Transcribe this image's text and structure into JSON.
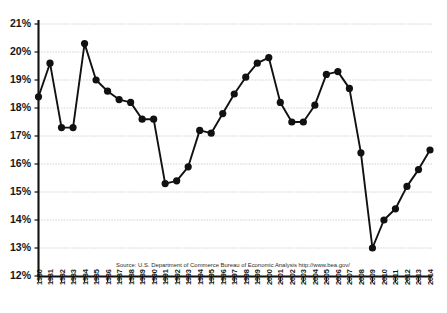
{
  "chart_data": {
    "type": "line",
    "title": "",
    "subtitle": "",
    "xlabel": "",
    "ylabel": "",
    "xlim": [
      1980,
      2014
    ],
    "ylim": [
      12,
      21
    ],
    "ytick_labels": [
      "21%",
      "20%",
      "19%",
      "18%",
      "17%",
      "16%",
      "15%",
      "14%",
      "13%",
      "12%"
    ],
    "ytick_values": [
      21,
      20,
      19,
      18,
      17,
      16,
      15,
      14,
      13,
      12
    ],
    "grid": true,
    "legend": "none",
    "marker": "filled-circle",
    "series_color": "#111111",
    "grid_color": "#c9c9c9",
    "axis_color": "#111111",
    "categories": [
      "1980",
      "1981",
      "1982",
      "1983",
      "1984",
      "1985",
      "1986",
      "1987",
      "1988",
      "1989",
      "1990",
      "1991",
      "1992",
      "1993",
      "1994",
      "1995",
      "1996",
      "1997",
      "1998",
      "1999",
      "2000",
      "2001",
      "2002",
      "2003",
      "2004",
      "2005",
      "2006",
      "2007",
      "2008",
      "2009",
      "2010",
      "2011",
      "2012",
      "2013",
      "2014"
    ],
    "values": [
      18.4,
      19.6,
      17.3,
      17.3,
      20.3,
      19.0,
      18.6,
      18.3,
      18.2,
      17.6,
      17.6,
      15.3,
      15.4,
      15.9,
      17.2,
      17.1,
      17.8,
      18.5,
      19.1,
      19.6,
      19.8,
      18.2,
      17.5,
      17.5,
      18.1,
      19.2,
      19.3,
      18.7,
      16.4,
      13.0,
      14.0,
      14.4,
      15.2,
      15.8,
      16.5
    ],
    "annotations": [
      {
        "name": "source-note",
        "text": "Source: U.S. Department of Commerce Bureau of Economic Analysis http://www.bea.gov/"
      }
    ]
  }
}
